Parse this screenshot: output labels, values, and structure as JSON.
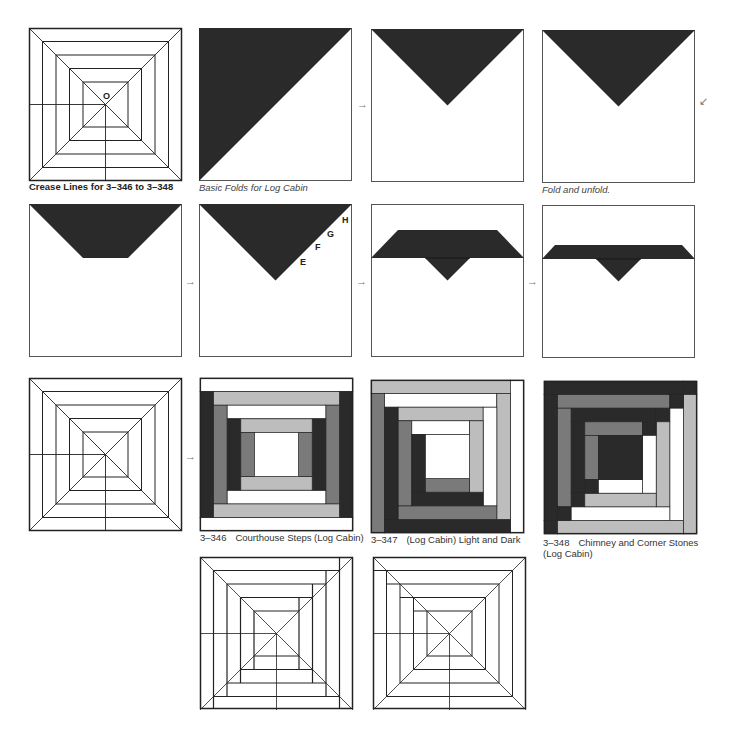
{
  "colors": {
    "dark": "#2a2a2a",
    "mid": "#7a7a7a",
    "light": "#bdbdbd",
    "white": "#ffffff",
    "line": "#222222"
  },
  "captions": {
    "crease_lines": "Crease Lines for 3–346 to 3–348",
    "basic_folds": "Basic Folds for Log Cabin",
    "fold_unfold": "Fold and unfold.",
    "block_346": {
      "num": "3–346",
      "title": "Courthouse Steps (Log Cabin)"
    },
    "block_347": {
      "num": "3–347",
      "title": "(Log Cabin) Light and Dark"
    },
    "block_348": {
      "num": "3–348",
      "title": "Chimney and Corner Stones (Log Cabin)"
    }
  },
  "center_label": "O",
  "edge_labels": [
    "H",
    "G",
    "F",
    "E"
  ],
  "arrows": {
    "right": "→",
    "down_left": "↙"
  }
}
